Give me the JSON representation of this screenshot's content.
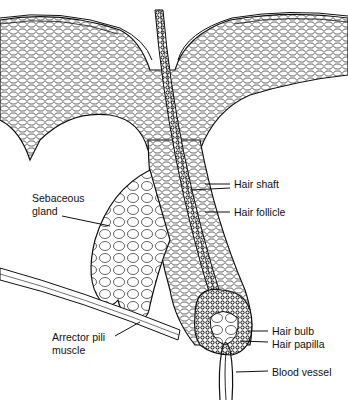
{
  "diagram": {
    "labels": {
      "hair_shaft": "Hair shaft",
      "hair_follicle": "Hair follicle",
      "sebaceous_gland_1": "Sebaceous",
      "sebaceous_gland_2": "gland",
      "hair_bulb": "Hair bulb",
      "hair_papilla": "Hair papilla",
      "arrector_1": "Arrector pili",
      "arrector_2": "muscle",
      "blood_vessel": "Blood vessel"
    },
    "colors": {
      "ink": "#111111",
      "background": "#ffffff"
    }
  }
}
